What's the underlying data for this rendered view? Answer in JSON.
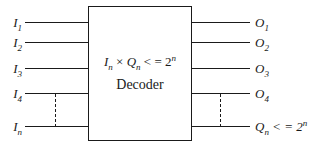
{
  "diagram": {
    "box": {
      "formula": {
        "var1": "I",
        "var1_sub": "n",
        "operator": " × ",
        "var2": "Q",
        "var2_sub": "n",
        "relation": " < = 2",
        "exponent": "n"
      },
      "title": "Decoder"
    },
    "inputs": [
      {
        "base": "I",
        "sub": "1"
      },
      {
        "base": "I",
        "sub": "2"
      },
      {
        "base": "I",
        "sub": "3"
      },
      {
        "base": "I",
        "sub": "4"
      },
      {
        "base": "I",
        "sub": "n"
      }
    ],
    "outputs": [
      {
        "base": "O",
        "sub": "1"
      },
      {
        "base": "O",
        "sub": "2"
      },
      {
        "base": "O",
        "sub": "3"
      },
      {
        "base": "O",
        "sub": "4"
      },
      {
        "base": "Q",
        "sub": "n",
        "rest": " < = 2",
        "sup": "n"
      }
    ],
    "colors": {
      "line": "#1a1a1a",
      "background": "#ffffff",
      "text": "#1a1a1a"
    }
  }
}
